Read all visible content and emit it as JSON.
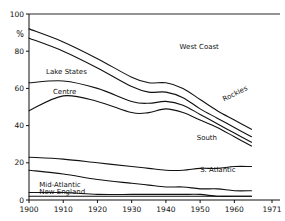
{
  "chart_data": {
    "type": "line",
    "title": "",
    "xlabel": "",
    "ylabel": "%",
    "xlim": [
      1900,
      1971
    ],
    "ylim": [
      0,
      100
    ],
    "grid": false,
    "legend": "inline-labels",
    "xticks": [
      "1900",
      "1910",
      "1920",
      "1930",
      "1940",
      "1950",
      "1960",
      "1971"
    ],
    "xtick_values": [
      1900,
      1910,
      1920,
      1930,
      1940,
      1950,
      1960,
      1971
    ],
    "yticks": [
      "0",
      "20",
      "40",
      "60",
      "80",
      "100"
    ],
    "ytick_values": [
      0,
      20,
      40,
      60,
      80,
      100
    ],
    "x": [
      1900,
      1910,
      1920,
      1930,
      1935,
      1940,
      1945,
      1950,
      1955,
      1960,
      1965
    ],
    "series": [
      {
        "name": "West Coast",
        "label": "West Coast",
        "values": [
          92,
          85,
          76,
          66,
          63,
          63,
          60,
          54,
          48,
          43,
          38
        ]
      },
      {
        "name": "Lake States",
        "label": "Lake States",
        "values": [
          87,
          80,
          71,
          61,
          58,
          58,
          55,
          49,
          44,
          39,
          34
        ]
      },
      {
        "name": "Rockies",
        "label": "Rockies",
        "values": [
          63,
          64,
          60,
          53,
          52,
          53,
          51,
          46,
          41,
          36,
          31
        ]
      },
      {
        "name": "Centre",
        "label": "Centre",
        "values": [
          48,
          56,
          53,
          47,
          47,
          49,
          47,
          43,
          39,
          34,
          29
        ]
      },
      {
        "name": "South",
        "label": "South",
        "values": [
          23,
          22,
          20,
          18,
          17,
          16,
          16,
          17,
          17,
          18,
          18
        ]
      },
      {
        "name": "S. Atlantic",
        "label": "S. Atlantic",
        "values": [
          16,
          14,
          11,
          9,
          8,
          7,
          7,
          6,
          6,
          5,
          5
        ]
      },
      {
        "name": "Mid-Atlantic",
        "label": "Mid-Atlantic",
        "values": [
          4,
          4,
          3,
          3,
          3,
          3,
          3,
          3,
          2,
          2,
          2
        ]
      },
      {
        "name": "New England",
        "label": "New England",
        "values": [
          2,
          2,
          2,
          2,
          2,
          2,
          2,
          2,
          2,
          2,
          2
        ]
      }
    ],
    "annotations": [
      {
        "text": "Lake States",
        "x": 1905,
        "y": 68
      },
      {
        "text": "Centre",
        "x": 1907,
        "y": 57
      },
      {
        "text": "West Coast",
        "x": 1944,
        "y": 81
      },
      {
        "text": "Rockies",
        "x": 1957,
        "y": 53,
        "rotated": true
      },
      {
        "text": "South",
        "x": 1949,
        "y": 32
      },
      {
        "text": "S. Atlantic",
        "x": 1950,
        "y": 15
      },
      {
        "text": "Mid-Atlantic",
        "x": 1903,
        "y": 7
      },
      {
        "text": "New England",
        "x": 1903,
        "y": 3
      }
    ]
  },
  "axis": {
    "y_unit_symbol": "%"
  }
}
